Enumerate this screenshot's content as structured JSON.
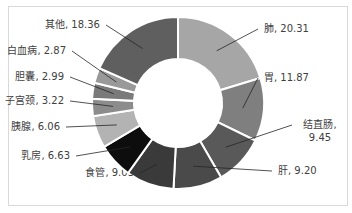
{
  "chart_data": {
    "type": "pie",
    "variant": "donut",
    "title": "",
    "categories": [
      "肺",
      "胃",
      "结直肠",
      "肝",
      "食管",
      "乳房",
      "胰腺",
      "子宫颈",
      "胆囊",
      "白血病",
      "其他"
    ],
    "values": [
      20.31,
      11.87,
      9.45,
      9.2,
      9.03,
      6.63,
      6.06,
      3.22,
      2.99,
      2.87,
      18.36
    ],
    "labels": [
      "肺, 20.31",
      "胃, 11.87",
      "结直肠,",
      "肝, 9.20",
      "食管, 9.03",
      "乳房, 6.63",
      "胰腺, 6.06",
      "子宫颈, 3.22",
      "胆囊, 2.99",
      "白血病, 2.87",
      "其他, 18.36"
    ],
    "label_line2": {
      "结直肠,": "9.45"
    },
    "colors": [
      "#a6a6a6",
      "#7f7f7f",
      "#595959",
      "#4a4a4a",
      "#3a3a3a",
      "#0d0d0d",
      "#b3b3b3",
      "#8c8c8c",
      "#7a7a7a",
      "#999999",
      "#5f5f5f"
    ],
    "legend": "none"
  }
}
